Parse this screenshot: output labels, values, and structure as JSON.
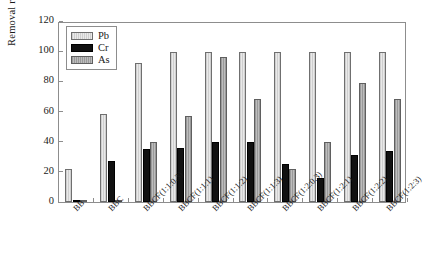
{
  "chart_data": {
    "type": "bar",
    "title": "",
    "xlabel": "",
    "ylabel": "Removal rate (%)",
    "ylim": [
      0,
      120
    ],
    "yticks": [
      0,
      20,
      40,
      60,
      80,
      100,
      120
    ],
    "grid": false,
    "legend_position": "top-left",
    "categories": [
      "BB",
      "BBC",
      "BBCF(1:1:0.3)",
      "BBCF(1:1:1)",
      "BBCF(1:1:2)",
      "BBCF(1:1:3)",
      "BBCF(1:2:0.3)",
      "BBCF(1:2:1)",
      "BBCF(1:2:2)",
      "BBCF(1:2:3)"
    ],
    "series": [
      {
        "name": "Pb",
        "color": "#dcdcdc",
        "values": [
          22,
          58.5,
          92,
          99.5,
          99.5,
          99.5,
          99.5,
          99.5,
          99.5,
          99.5
        ]
      },
      {
        "name": "Cr",
        "color": "#111111",
        "values": [
          0.6,
          27,
          35,
          35.5,
          39.5,
          40,
          25,
          16,
          31,
          34
        ]
      },
      {
        "name": "As",
        "color": "#a8a8a8",
        "values": [
          1.2,
          0.8,
          39.5,
          57,
          96,
          68,
          22,
          40,
          79,
          68
        ]
      }
    ]
  }
}
